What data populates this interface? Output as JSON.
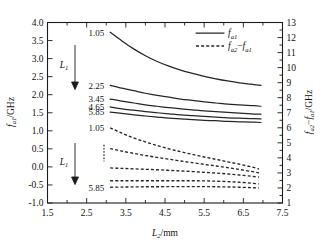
{
  "chart_data": {
    "type": "line",
    "title": "",
    "xlabel": "L2/mm",
    "xlabel_parts": {
      "var": "L",
      "sub": "2",
      "unit": "/mm"
    },
    "ylabel_left": "fa1/GHz",
    "ylabel_left_parts": {
      "var": "f",
      "sub": "a1",
      "unit": "/GHz"
    },
    "ylabel_right": "fa2-fa1/GHz",
    "ylabel_right_parts": {
      "var1": "f",
      "sub1": "a2",
      "minus": "−",
      "var2": "f",
      "sub2": "a1",
      "unit": "/GHz"
    },
    "grid": false,
    "xlim": [
      1.5,
      7.5
    ],
    "xticks": [
      "1.5",
      "2.5",
      "3.5",
      "4.5",
      "5.5",
      "6.5",
      "7.5"
    ],
    "xtick_values": [
      1.5,
      2.5,
      3.5,
      4.5,
      5.5,
      6.5,
      7.5
    ],
    "xminor_step": 0.5,
    "ylim_left": [
      -1.0,
      4.0
    ],
    "yticks_left": [
      "4.0",
      "3.5",
      "3.0",
      "2.5",
      "2.0",
      "1.5",
      "1.0",
      "0.5",
      "0.0",
      "-0.5",
      "-1.0"
    ],
    "ytick_values_left": [
      4.0,
      3.5,
      3.0,
      2.5,
      2.0,
      1.5,
      1.0,
      0.5,
      0.0,
      -0.5,
      -1.0
    ],
    "ylim_right": [
      1,
      13
    ],
    "yticks_right": [
      "13",
      "12",
      "11",
      "10",
      "9",
      "8",
      "7",
      "6",
      "5",
      "4",
      "3",
      "2",
      "1"
    ],
    "ytick_values_right": [
      13,
      12,
      11,
      10,
      9,
      8,
      7,
      6,
      5,
      4,
      3,
      2,
      1
    ],
    "legend_position": "top-right",
    "legend": [
      {
        "label": "fa1",
        "parts": {
          "var": "f",
          "sub": "a1"
        },
        "style": "solid",
        "name": "legend-fa1"
      },
      {
        "label": "fa2-fa1",
        "parts": {
          "var1": "f",
          "sub1": "a2",
          "minus": "−",
          "var2": "f",
          "sub2": "a1"
        },
        "style": "dashed",
        "name": "legend-fa2-minus-fa1"
      }
    ],
    "series": [
      {
        "name": "fa1 L1=1.05",
        "style": "solid",
        "axis": "left",
        "param_label": "1.05",
        "x": [
          3.1,
          3.4,
          3.7,
          4.0,
          4.3,
          4.6,
          4.9,
          5.2,
          5.5,
          5.8,
          6.1,
          6.4,
          6.7,
          6.95
        ],
        "y": [
          3.73,
          3.49,
          3.27,
          3.08,
          2.92,
          2.79,
          2.68,
          2.59,
          2.51,
          2.44,
          2.38,
          2.33,
          2.29,
          2.26
        ]
      },
      {
        "name": "fa1 L1=2.25",
        "style": "solid",
        "axis": "left",
        "param_label": "2.25",
        "x": [
          3.1,
          3.4,
          3.7,
          4.0,
          4.3,
          4.6,
          4.9,
          5.2,
          5.5,
          5.8,
          6.1,
          6.4,
          6.7,
          6.95
        ],
        "y": [
          2.26,
          2.18,
          2.11,
          2.04,
          1.98,
          1.93,
          1.88,
          1.84,
          1.8,
          1.77,
          1.74,
          1.72,
          1.7,
          1.68
        ]
      },
      {
        "name": "fa1 L1=3.45",
        "style": "solid",
        "axis": "left",
        "param_label": "3.45",
        "x": [
          3.1,
          3.4,
          3.7,
          4.0,
          4.3,
          4.6,
          4.9,
          5.2,
          5.5,
          5.8,
          6.1,
          6.4,
          6.7,
          6.95
        ],
        "y": [
          1.88,
          1.82,
          1.77,
          1.72,
          1.68,
          1.64,
          1.61,
          1.58,
          1.55,
          1.53,
          1.51,
          1.49,
          1.47,
          1.46
        ]
      },
      {
        "name": "fa1 L1=4.65",
        "style": "solid",
        "axis": "left",
        "param_label": "4.65",
        "x": [
          3.1,
          3.4,
          3.7,
          4.0,
          4.3,
          4.6,
          4.9,
          5.2,
          5.5,
          5.8,
          6.1,
          6.4,
          6.7,
          6.95
        ],
        "y": [
          1.66,
          1.61,
          1.57,
          1.53,
          1.5,
          1.47,
          1.44,
          1.42,
          1.4,
          1.38,
          1.36,
          1.35,
          1.34,
          1.33
        ]
      },
      {
        "name": "fa1 L1=5.85",
        "style": "solid",
        "axis": "left",
        "param_label": "5.85",
        "x": [
          3.1,
          3.4,
          3.7,
          4.0,
          4.3,
          4.6,
          4.9,
          5.2,
          5.5,
          5.8,
          6.1,
          6.4,
          6.7,
          6.95
        ],
        "y": [
          1.52,
          1.48,
          1.44,
          1.41,
          1.38,
          1.35,
          1.33,
          1.31,
          1.29,
          1.28,
          1.26,
          1.25,
          1.24,
          1.23
        ]
      },
      {
        "name": "fa2-fa1 L1=1.05",
        "style": "dashed",
        "axis": "right",
        "param_label": "1.05",
        "x": [
          3.1,
          3.4,
          3.7,
          4.0,
          4.3,
          4.6,
          4.9,
          5.2,
          5.5,
          5.8,
          6.1,
          6.4,
          6.7,
          6.9
        ],
        "y": [
          6.0,
          5.64,
          5.33,
          5.06,
          4.82,
          4.6,
          4.41,
          4.23,
          4.06,
          3.9,
          3.74,
          3.58,
          3.4,
          3.26
        ]
      },
      {
        "name": "fa2-fa1 L1=2.25",
        "style": "dashed",
        "axis": "right",
        "param_label": "",
        "x": [
          3.1,
          3.4,
          3.7,
          4.0,
          4.3,
          4.6,
          4.9,
          5.2,
          5.5,
          5.8,
          6.1,
          6.4,
          6.7,
          6.9
        ],
        "y": [
          4.62,
          4.45,
          4.3,
          4.16,
          4.03,
          3.91,
          3.79,
          3.68,
          3.57,
          3.46,
          3.35,
          3.23,
          3.1,
          3.0
        ]
      },
      {
        "name": "fa2-fa1 L1=3.45",
        "style": "dashed",
        "axis": "right",
        "param_label": "",
        "x": [
          3.1,
          3.4,
          3.7,
          4.0,
          4.3,
          4.6,
          4.9,
          5.2,
          5.5,
          5.8,
          6.1,
          6.4,
          6.7,
          6.9
        ],
        "y": [
          3.33,
          3.3,
          3.27,
          3.24,
          3.21,
          3.17,
          3.13,
          3.09,
          3.04,
          2.99,
          2.93,
          2.86,
          2.78,
          2.72
        ]
      },
      {
        "name": "fa2-fa1 L1=4.65",
        "style": "dashed",
        "axis": "right",
        "param_label": "",
        "x": [
          3.1,
          3.4,
          3.7,
          4.0,
          4.3,
          4.6,
          4.9,
          5.2,
          5.5,
          5.8,
          6.1,
          6.4,
          6.7,
          6.9
        ],
        "y": [
          2.48,
          2.48,
          2.48,
          2.48,
          2.48,
          2.48,
          2.48,
          2.48,
          2.47,
          2.45,
          2.42,
          2.38,
          2.32,
          2.27
        ]
      },
      {
        "name": "fa2-fa1 L1=5.85",
        "style": "dashed",
        "axis": "right",
        "param_label": "5.85",
        "x": [
          3.1,
          3.4,
          3.7,
          4.0,
          4.3,
          4.6,
          4.9,
          5.2,
          5.5,
          5.8,
          6.1,
          6.4,
          6.7,
          6.9
        ],
        "y": [
          2.05,
          2.06,
          2.07,
          2.08,
          2.08,
          2.09,
          2.09,
          2.09,
          2.09,
          2.08,
          2.07,
          2.05,
          2.02,
          2.0
        ]
      }
    ],
    "annotations": {
      "upper_group": {
        "arrow_label": "L1",
        "arrow_label_parts": {
          "var": "L",
          "sub": "1"
        },
        "arrow_direction": "down",
        "values": [
          "1.05",
          "2.25",
          "3.45",
          "4.65",
          "5.85"
        ]
      },
      "lower_group": {
        "arrow_label": "L1",
        "arrow_label_parts": {
          "var": "L",
          "sub": "1"
        },
        "arrow_direction": "down",
        "values": [
          "1.05",
          "5.85"
        ],
        "ellipsis": "vertical-dots"
      }
    },
    "colors": {
      "axis": "#1b1b1b",
      "curve": "#262626",
      "background": "#ffffff"
    }
  }
}
